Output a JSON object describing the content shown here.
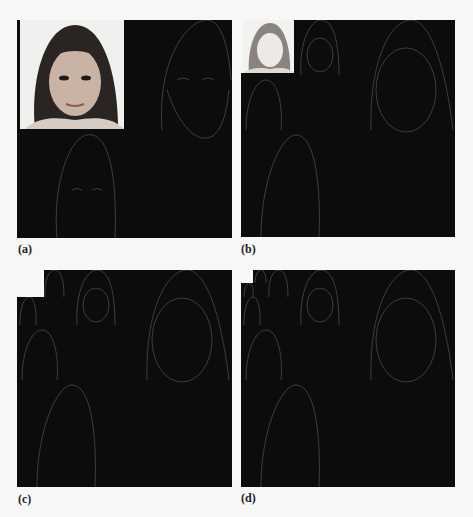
{
  "figure": {
    "type": "multi-panel image figure",
    "panels": [
      {
        "id": "a",
        "label": "(a)",
        "levels": 1
      },
      {
        "id": "b",
        "label": "(b)",
        "levels": 2
      },
      {
        "id": "c",
        "label": "(c)",
        "levels": 3
      },
      {
        "id": "d",
        "label": "(d)",
        "levels": 4
      }
    ]
  },
  "colors": {
    "background": "#f7f7f5",
    "subband": "#0c0c0c",
    "edge": "#5a5a5a"
  }
}
